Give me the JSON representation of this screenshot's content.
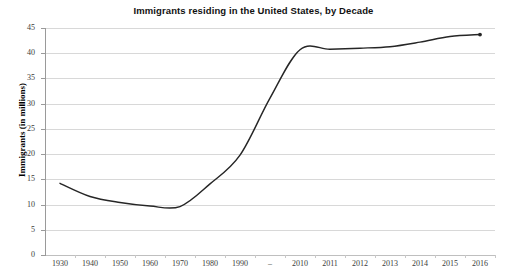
{
  "chart_data": {
    "type": "line",
    "title": "Immigrants residing in the United States, by Decade",
    "xlabel": "",
    "ylabel": "Immigrants (in millions)",
    "categories": [
      "1930",
      "1940",
      "1950",
      "1960",
      "1970",
      "1980",
      "1990",
      "–",
      "2010",
      "2011",
      "2012",
      "2013",
      "2014",
      "2015",
      "2016"
    ],
    "values": [
      14.2,
      11.6,
      10.4,
      9.7,
      9.6,
      14.1,
      19.8,
      31.1,
      40.7,
      40.8,
      41.0,
      41.3,
      42.2,
      43.3,
      43.7
    ],
    "series": [
      {
        "name": "Immigrants (in millions)",
        "values": [
          14.2,
          11.6,
          10.4,
          9.7,
          9.6,
          14.1,
          19.8,
          31.1,
          40.7,
          40.8,
          41.0,
          41.3,
          42.2,
          43.3,
          43.7
        ]
      }
    ],
    "ylim": [
      0,
      45
    ],
    "yticks": [
      0,
      5,
      10,
      15,
      20,
      25,
      30,
      35,
      40,
      45
    ],
    "ytick_labels": [
      "0",
      "5",
      "10",
      "15",
      "20",
      "25",
      "30",
      "35",
      "40",
      "45"
    ],
    "grid": "horizontal",
    "legend": "none",
    "line_color": "#262626",
    "gridline_color": "#d8d8d8",
    "background_color": "#ffffff",
    "smoothed": true,
    "end_marker": true
  }
}
